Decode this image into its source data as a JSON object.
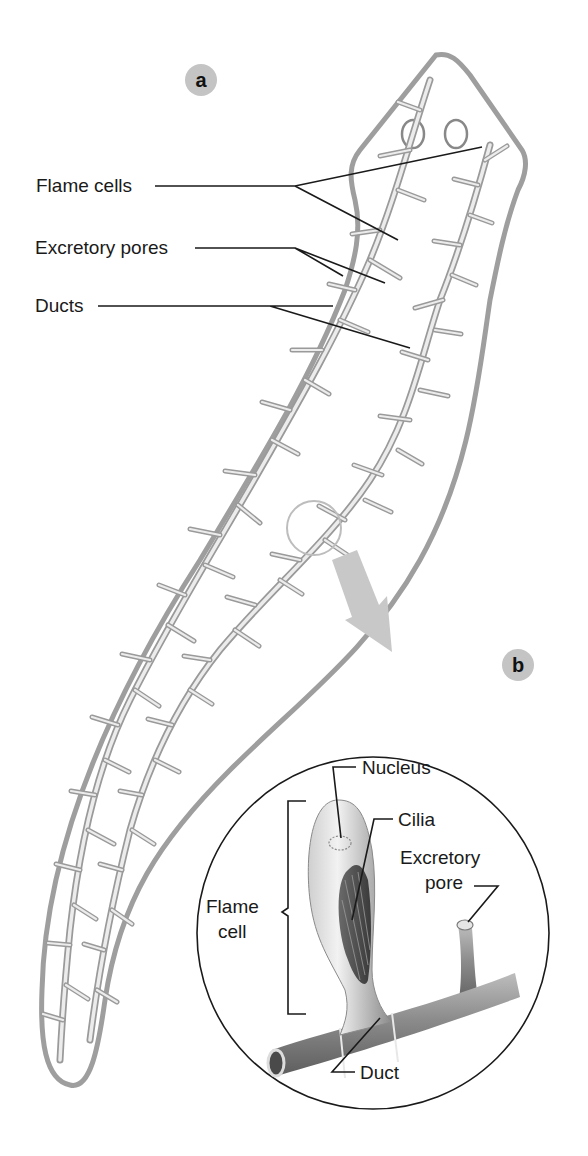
{
  "figure": {
    "panel_a": {
      "badge": "a"
    },
    "panel_b": {
      "badge": "b"
    },
    "labels_a": {
      "flame_cells": "Flame cells",
      "excretory_pores": "Excretory pores",
      "ducts": "Ducts"
    },
    "labels_b": {
      "nucleus": "Nucleus",
      "cilia": "Cilia",
      "excretory_pore_line1": "Excretory",
      "excretory_pore_line2": "pore",
      "flame_cell_line1": "Flame",
      "flame_cell_line2": "cell",
      "duct": "Duct"
    },
    "colors": {
      "body_outline": "#9e9e9e",
      "badge_fill": "#c4c4c4",
      "magnifier_circle": "#bdbdbd",
      "arrow": "#c8c8c8",
      "text": "#1a1a1a"
    }
  }
}
